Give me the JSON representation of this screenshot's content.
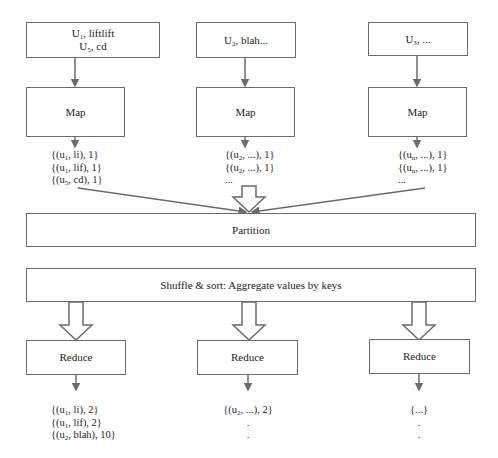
{
  "inputs": [
    {
      "line1_base": "U",
      "line1_sub": "1",
      "line1_rest": ", liftlift",
      "line2_base": "U",
      "line2_sub": "5",
      "line2_rest": ", cd"
    },
    {
      "line1_base": "U",
      "line1_sub": "2",
      "line1_rest": ", blah..."
    },
    {
      "line1_base": "U",
      "line1_sub": "3",
      "line1_rest": ", ..."
    }
  ],
  "map_label": "Map",
  "map_outputs": [
    [
      {
        "pre": "{(u",
        "sub": "1",
        "post": ", li), 1}"
      },
      {
        "pre": "{(u",
        "sub": "1",
        "post": ", lif), 1}"
      },
      {
        "pre": "{(u",
        "sub": "5",
        "post": ", cd), 1}"
      }
    ],
    [
      {
        "pre": "{(u",
        "sub": "2",
        "post": ", ...), 1}"
      },
      {
        "pre": "{(u",
        "sub": "2",
        "post": ", ...), 1}"
      },
      {
        "pre": "...",
        "sub": "",
        "post": ""
      }
    ],
    [
      {
        "pre": "{(u",
        "sub": "n",
        "post": ", ...), 1}"
      },
      {
        "pre": "{(u",
        "sub": "n",
        "post": ", ...), 1}"
      },
      {
        "pre": "...",
        "sub": "",
        "post": ""
      }
    ]
  ],
  "partition_label": "Partition",
  "shuffle_label": "Shuffle & sort: Aggregate values by keys",
  "reduce_label": "Reduce",
  "reduce_outputs": [
    [
      {
        "pre": "{(u",
        "sub": "1",
        "post": ", li), 2}"
      },
      {
        "pre": "{(u",
        "sub": "1",
        "post": ", lif), 2}"
      },
      {
        "pre": "{(u",
        "sub": "2",
        "post": ", blah), 10}"
      }
    ],
    [
      {
        "pre": "{(u",
        "sub": "2",
        "post": ", ...), 2}"
      },
      {
        "pre": ".",
        "sub": "",
        "post": ""
      },
      {
        "pre": ".",
        "sub": "",
        "post": ""
      }
    ],
    [
      {
        "pre": "{...}",
        "sub": "",
        "post": ""
      },
      {
        "pre": ".",
        "sub": "",
        "post": ""
      },
      {
        "pre": ".",
        "sub": "",
        "post": ""
      }
    ]
  ],
  "colors": {
    "stroke": "#6b6b6b",
    "text": "#222222",
    "background": "#ffffff"
  }
}
